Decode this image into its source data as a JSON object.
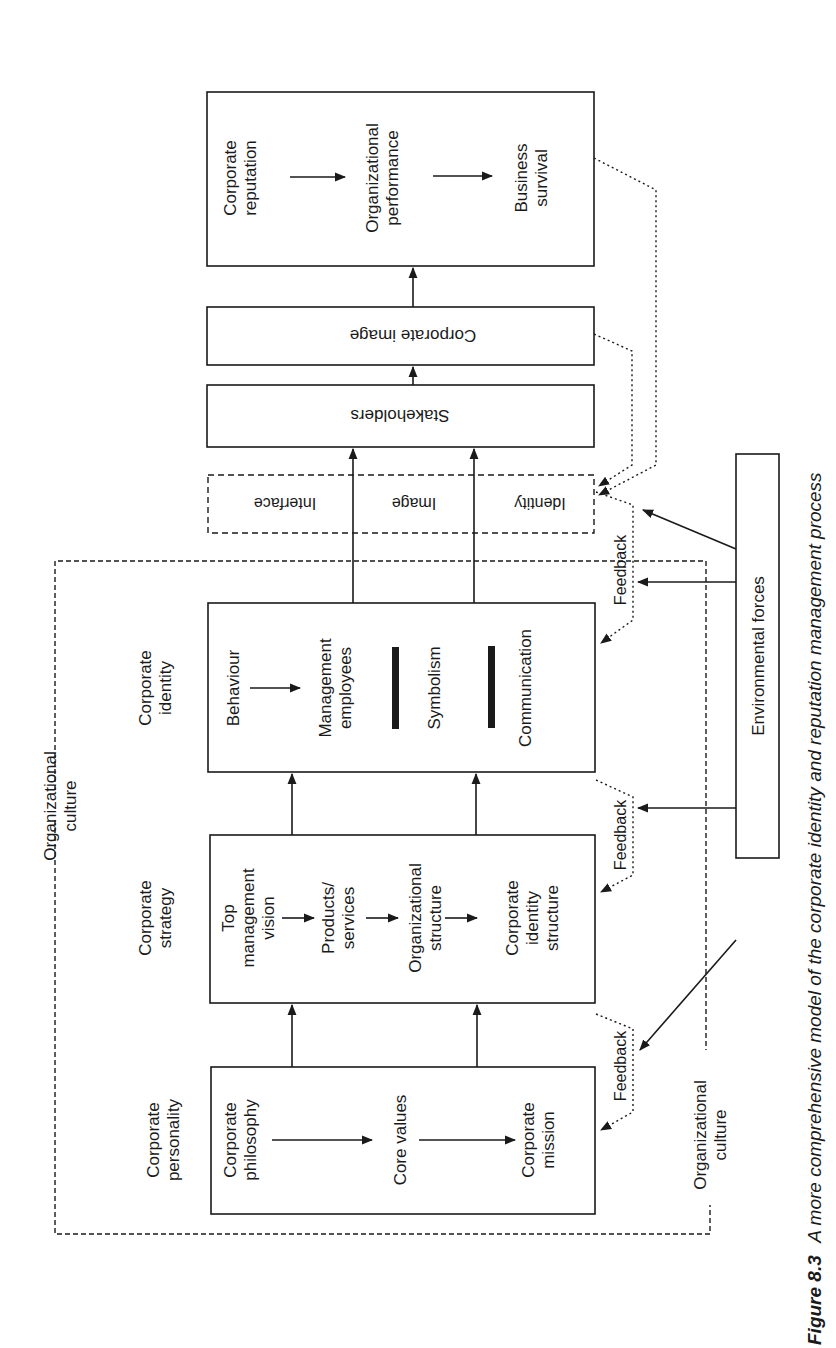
{
  "figure": {
    "caption_label": "Figure 8.3",
    "caption_text": "A more comprehensive model of the corporate identity and reputation management process",
    "orientation": "rotated 90° counter-clockwise (reads bottom-to-top)"
  },
  "stages": {
    "personality": {
      "heading": [
        "Corporate",
        "personality"
      ],
      "items": [
        [
          "Corporate",
          "philosophy"
        ],
        [
          "Core values"
        ],
        [
          "Corporate",
          "mission"
        ]
      ]
    },
    "strategy": {
      "heading": [
        "Corporate",
        "strategy"
      ],
      "items": [
        [
          "Top",
          "management",
          "vision"
        ],
        [
          "Products/",
          "services"
        ],
        [
          "Organizational",
          "structure"
        ],
        [
          "Corporate",
          "identity",
          "structure"
        ]
      ]
    },
    "identity": {
      "heading": [
        "Corporate",
        "identity"
      ],
      "items": [
        [
          "Behaviour"
        ],
        [
          "Management",
          "employees"
        ],
        [
          "Symbolism"
        ],
        [
          "Communication"
        ]
      ]
    },
    "interfaces": {
      "items": [
        "Identity",
        "Image",
        "Interface"
      ],
      "border": "dashed"
    },
    "stakeholders": {
      "label": "Stakeholders"
    },
    "corporate_image": {
      "label": "Corporate image"
    },
    "reputation": {
      "items": [
        [
          "Corporate",
          "reputation"
        ],
        [
          "Organizational",
          "performance"
        ],
        [
          "Business",
          "survival"
        ]
      ]
    }
  },
  "environment": {
    "label": "Environmental forces"
  },
  "org_culture": {
    "label_top": [
      "Organizational",
      "culture"
    ],
    "label_bottom": [
      "Organizational",
      "culture"
    ]
  },
  "feedback": {
    "label": "Feedback",
    "count": 3
  },
  "colors": {
    "ink": "#1a1a1a",
    "background": "#ffffff"
  }
}
